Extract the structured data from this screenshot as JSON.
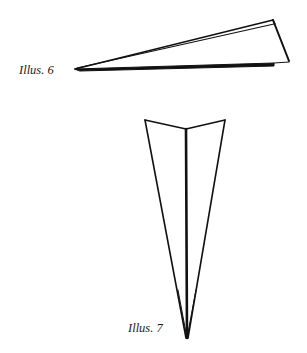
{
  "illustrations": [
    {
      "id": "illus-6",
      "label": "Illus. 6",
      "description": "Paper airplane viewed from the side, a long thin triangle",
      "stroke_color": "#111111"
    },
    {
      "id": "illus-7",
      "label": "Illus. 7",
      "description": "Paper airplane viewed from above, a long narrow V with a center fold",
      "stroke_color": "#111111"
    }
  ],
  "colors": {
    "background": "#ffffff",
    "stroke": "#111111",
    "text": "#1a1a1a"
  }
}
